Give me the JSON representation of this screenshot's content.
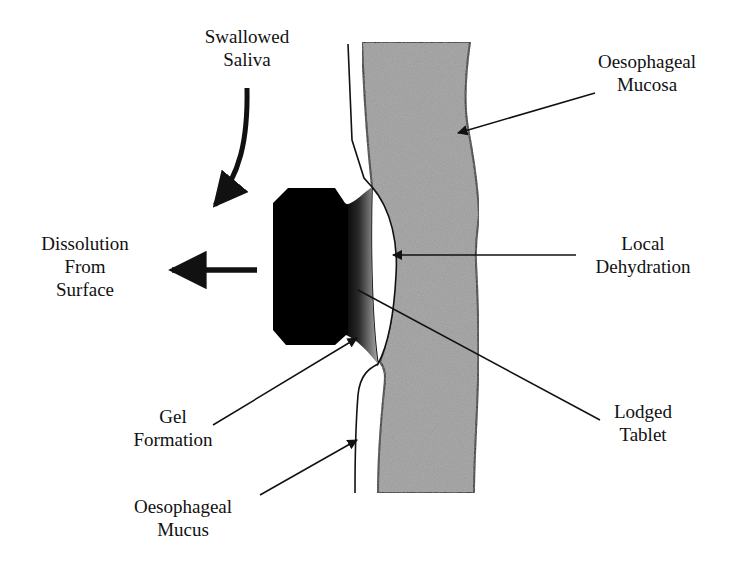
{
  "diagram": {
    "type": "anatomical-schematic",
    "colors": {
      "background": "#ffffff",
      "mucosa_fill": "#9a9a9a",
      "tablet_fill": "#000000",
      "outline": "#111111"
    },
    "labels": {
      "swallowed_saliva": {
        "line1": "Swallowed",
        "line2": "Saliva"
      },
      "dissolution": {
        "line1": "Dissolution",
        "line2": "From",
        "line3": "Surface"
      },
      "gel_formation": {
        "line1": "Gel",
        "line2": "Formation"
      },
      "oesophageal_mucus": {
        "line1": "Oesophageal",
        "line2": "Mucus"
      },
      "oesophageal_mucosa": {
        "line1": "Oesophageal",
        "line2": "Mucosa"
      },
      "local_dehydration": {
        "line1": "Local",
        "line2": "Dehydration"
      },
      "lodged_tablet": {
        "line1": "Lodged",
        "line2": "Tablet"
      }
    },
    "arrows": [
      {
        "name": "saliva-flow-arrow",
        "from": "Swallowed Saliva",
        "direction": "down-left"
      },
      {
        "name": "dissolution-arrow",
        "from": "Tablet surface",
        "direction": "left"
      },
      {
        "name": "mucosa-pointer",
        "target": "Oesophageal Mucosa"
      },
      {
        "name": "dehydration-pointer",
        "target": "Local Dehydration"
      },
      {
        "name": "tablet-pointer",
        "target": "Lodged Tablet"
      },
      {
        "name": "gel-pointer",
        "target": "Gel Formation"
      },
      {
        "name": "mucus-pointer",
        "target": "Oesophageal Mucus"
      }
    ]
  }
}
